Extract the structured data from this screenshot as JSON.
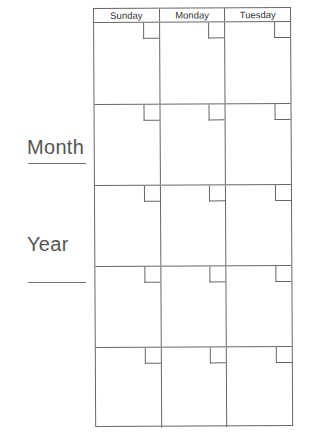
{
  "sidebar": {
    "month_label": "Month",
    "year_label": "Year"
  },
  "calendar": {
    "days": [
      "Sunday",
      "Monday",
      "Tuesday"
    ],
    "weeks": 5
  }
}
